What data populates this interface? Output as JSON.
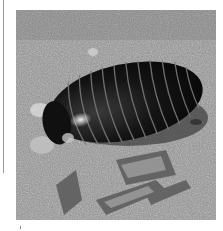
{
  "image": {
    "subject": "pill millipede on gravelly soil",
    "style": "black-and-white photograph",
    "alt": "Black glossy segmented pill millipede crawling on sandy soil with small stones and wood chips"
  },
  "colors": {
    "background": "#ffffff",
    "soil": "#8d8d8d",
    "millipede_body": "#121212",
    "segment_lines": "#6e6e6e",
    "highlight": "#d8d8d8",
    "margin_line": "#9a9a9a"
  }
}
